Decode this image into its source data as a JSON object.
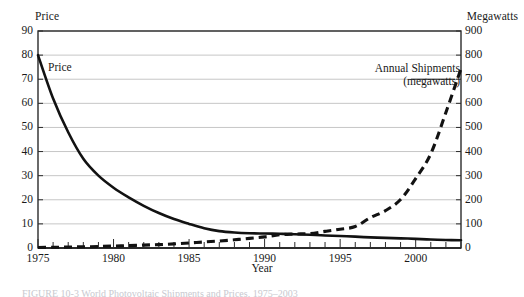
{
  "axes": {
    "left_title": "Price",
    "right_title": "Megawatts",
    "x_title": "Year",
    "left_ticks": [
      "0",
      "10",
      "20",
      "30",
      "40",
      "50",
      "60",
      "70",
      "80",
      "90"
    ],
    "right_ticks": [
      "0",
      "100",
      "200",
      "300",
      "400",
      "500",
      "600",
      "700",
      "800",
      "900"
    ],
    "x_ticks": [
      "1975",
      "1980",
      "1985",
      "1990",
      "1995",
      "2000"
    ]
  },
  "annotations": {
    "price_label": "Price",
    "shipments_label_line1": "Annual Shipments",
    "shipments_label_line2": "(megawatts)"
  },
  "caption": "FIGURE 10-3  World Photovoltaic Shipments and Prices, 1975–2003",
  "colors": {
    "ink": "#1a1a1a",
    "gridline": "#c6c6c6",
    "axis": "#2b2b2b",
    "background": "#ffffff"
  },
  "chart_data": {
    "type": "line",
    "title": "",
    "xlabel": "Year",
    "ylabel": "Price",
    "y2label": "Megawatts",
    "xlim": [
      1975,
      2003
    ],
    "ylim": [
      0,
      90
    ],
    "y2lim": [
      0,
      900
    ],
    "grid": "horizontal",
    "legend": "inline-annotations",
    "x": [
      1975,
      1976,
      1977,
      1978,
      1979,
      1980,
      1981,
      1982,
      1983,
      1984,
      1985,
      1986,
      1987,
      1988,
      1989,
      1990,
      1991,
      1992,
      1993,
      1994,
      1995,
      1996,
      1997,
      1998,
      1999,
      2000,
      2001,
      2002,
      2003
    ],
    "series": [
      {
        "name": "Price",
        "axis": "left",
        "style": "solid",
        "units": "dollars per watt",
        "values": [
          80,
          62,
          48,
          37,
          30,
          25,
          21,
          17.5,
          14.5,
          12,
          10,
          8.2,
          7.0,
          6.4,
          6.1,
          6.0,
          5.9,
          5.7,
          5.5,
          5.2,
          5.0,
          4.7,
          4.4,
          4.2,
          4.0,
          3.8,
          3.5,
          3.3,
          3.2
        ]
      },
      {
        "name": "Annual Shipments (megawatts)",
        "axis": "right",
        "style": "dashed",
        "units": "megawatts",
        "values": [
          2,
          3,
          4,
          5,
          6,
          8,
          10,
          12,
          14,
          17,
          21,
          25,
          29,
          34,
          40,
          46,
          55,
          58,
          60,
          69,
          78,
          89,
          126,
          155,
          201,
          288,
          391,
          562,
          744
        ]
      }
    ]
  }
}
